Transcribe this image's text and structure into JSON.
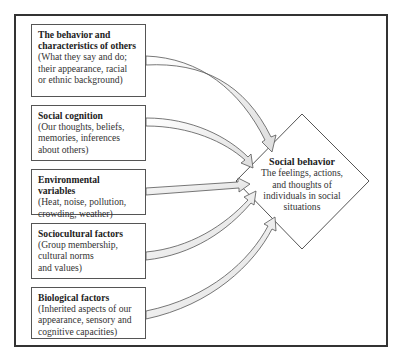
{
  "diagram": {
    "inputs": [
      {
        "title": "The behavior and\ncharacteristics of others",
        "description": "(What they say and do;\ntheir appearance, racial\nor ethnic background)"
      },
      {
        "title": "Social cognition",
        "description": "(Our thoughts, beliefs,\nmemories, inferences\nabout others)"
      },
      {
        "title": "Environmental variables",
        "description": "(Heat, noise, pollution,\ncrowding, weather)"
      },
      {
        "title": "Sociocultural factors",
        "description": "(Group membership,\ncultural norms\nand values)"
      },
      {
        "title": "Biological factors",
        "description": "(Inherited aspects of our\nappearance, sensory and\ncognitive capacities)"
      }
    ],
    "output": {
      "title": "Social behavior",
      "description": "The feelings, actions,\nand thoughts of\nindividuals in social\nsituations"
    },
    "colors": {
      "frame": "#333333",
      "box_border": "#555555",
      "arrow_fill": "#eeeeee",
      "arrow_stroke": "#555555"
    }
  }
}
